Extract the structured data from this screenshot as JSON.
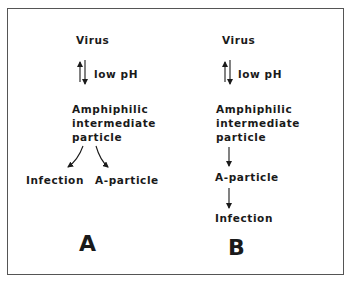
{
  "panels": {
    "A": {
      "label": "A",
      "virus": "Virus",
      "condition": "low pH",
      "intermediate": [
        "Amphiphilic",
        "intermediate",
        "particle"
      ],
      "branch_left": "Infection",
      "branch_right": "A-particle"
    },
    "B": {
      "label": "B",
      "virus": "Virus",
      "condition": "low pH",
      "intermediate": [
        "Amphiphilic",
        "intermediate",
        "particle"
      ],
      "step2": "A-particle",
      "step3": "Infection"
    }
  },
  "colors": {
    "ink": "#1a1a1a",
    "border": "#555555",
    "background": "#ffffff"
  }
}
